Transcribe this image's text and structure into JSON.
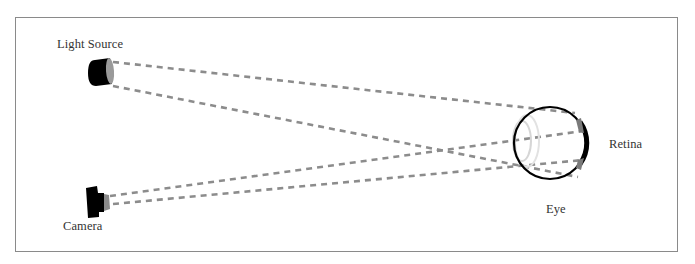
{
  "diagram": {
    "labels": {
      "light_source": "Light Source",
      "camera": "Camera",
      "retina": "Retina",
      "eye": "Eye"
    },
    "colors": {
      "frame": "#8a8a8a",
      "ray": "#8c8c8c",
      "device": "#000000",
      "lens": "#d0d0d0",
      "retina_highlight": "#7a7a7a",
      "text": "#333333"
    },
    "rays": [
      {
        "from": "light-source",
        "to": "retina-top",
        "x1": 113,
        "y1": 62,
        "x2": 575,
        "y2": 113
      },
      {
        "from": "light-source",
        "to": "retina-bottom",
        "x1": 113,
        "y1": 86,
        "x2": 578,
        "y2": 177
      },
      {
        "from": "camera",
        "to": "retina-top",
        "x1": 110,
        "y1": 196,
        "x2": 583,
        "y2": 131
      },
      {
        "from": "camera",
        "to": "retina-bottom",
        "x1": 113,
        "y1": 204,
        "x2": 583,
        "y2": 160
      }
    ]
  }
}
